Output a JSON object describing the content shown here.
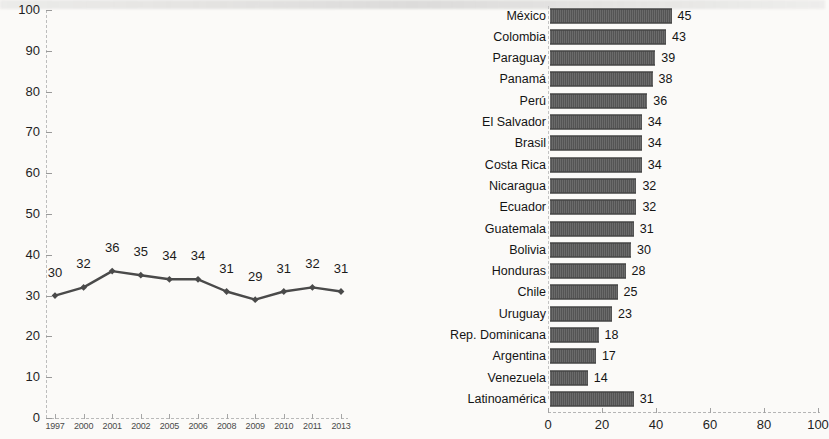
{
  "chart_data": [
    {
      "type": "line",
      "title": "",
      "xlabel": "",
      "ylabel": "",
      "ylim": [
        0,
        100
      ],
      "ytick_labels": [
        "0",
        "10",
        "20",
        "30",
        "40",
        "50",
        "60",
        "70",
        "80",
        "90",
        "100"
      ],
      "ytick_values": [
        0,
        10,
        20,
        30,
        40,
        50,
        60,
        70,
        80,
        90,
        100
      ],
      "categories": [
        "1997",
        "2000",
        "2001",
        "2002",
        "2005",
        "2006",
        "2008",
        "2009",
        "2010",
        "2011",
        "2013"
      ],
      "values": [
        30,
        32,
        36,
        35,
        34,
        34,
        31,
        29,
        31,
        32,
        31
      ],
      "data_labels": [
        "30",
        "32",
        "36",
        "35",
        "34",
        "34",
        "31",
        "29",
        "31",
        "32",
        "31"
      ],
      "grid": false,
      "legend": false,
      "marker": "diamond",
      "line_color": "#4a4a4a"
    },
    {
      "type": "bar",
      "orientation": "horizontal",
      "title": "",
      "xlabel": "",
      "ylabel": "",
      "xlim": [
        0,
        100
      ],
      "xtick_labels": [
        "0",
        "20",
        "40",
        "60",
        "80",
        "100"
      ],
      "xtick_values": [
        0,
        20,
        40,
        60,
        80,
        100
      ],
      "grid": false,
      "legend": false,
      "bar_color": "#5a5a5a",
      "categories": [
        "México",
        "Colombia",
        "Paraguay",
        "Panamá",
        "Perú",
        "El Salvador",
        "Brasil",
        "Costa Rica",
        "Nicaragua",
        "Ecuador",
        "Guatemala",
        "Bolivia",
        "Honduras",
        "Chile",
        "Uruguay",
        "Rep. Dominicana",
        "Argentina",
        "Venezuela",
        "Latinoamérica"
      ],
      "values": [
        45,
        43,
        39,
        38,
        36,
        34,
        34,
        34,
        32,
        32,
        31,
        30,
        28,
        25,
        23,
        18,
        17,
        14,
        31
      ],
      "data_labels": [
        "45",
        "43",
        "39",
        "38",
        "36",
        "34",
        "34",
        "34",
        "32",
        "32",
        "31",
        "30",
        "28",
        "25",
        "23",
        "18",
        "17",
        "14",
        "31"
      ]
    }
  ]
}
